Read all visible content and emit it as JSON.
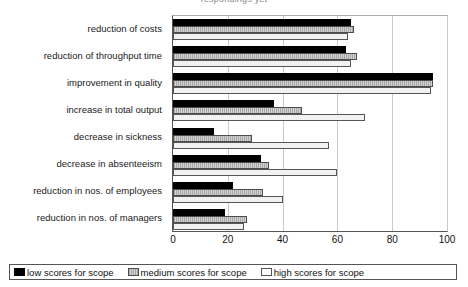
{
  "title_clipped": "respondings yet",
  "chart_data": {
    "type": "bar",
    "orientation": "horizontal",
    "title": "",
    "xlabel": "",
    "ylabel": "",
    "xlim": [
      0,
      100
    ],
    "xticks": [
      0,
      20,
      40,
      60,
      80,
      100
    ],
    "grid": true,
    "legend_position": "bottom",
    "categories": [
      "reduction of costs",
      "reduction of throughput time",
      "improvement in quality",
      "increase in total output",
      "decrease in sickness",
      "decrease in absenteeism",
      "reduction in nos. of employees",
      "reduction in nos. of managers"
    ],
    "series": [
      {
        "name": "low scores for scope",
        "color": "#000000",
        "values": [
          65,
          63,
          95,
          37,
          15,
          32,
          22,
          19
        ]
      },
      {
        "name": "medium scores for scope",
        "color": "#b3b3b3",
        "values": [
          66,
          67,
          95,
          47,
          29,
          35,
          33,
          27
        ]
      },
      {
        "name": "high scores for scope",
        "color": "#f2f2f2",
        "values": [
          64,
          65,
          94,
          70,
          57,
          60,
          40,
          26
        ]
      }
    ]
  },
  "legend": {
    "items": [
      {
        "label": "low scores for scope",
        "swatch": "low"
      },
      {
        "label": "medium scores for scope",
        "swatch": "medium"
      },
      {
        "label": "high scores for scope",
        "swatch": "high"
      }
    ]
  }
}
